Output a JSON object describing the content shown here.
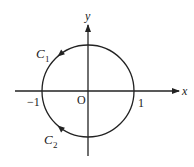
{
  "diagram": {
    "type": "complex-plane-contour",
    "axes": {
      "x_label": "x",
      "y_label": "y",
      "origin_label": "O"
    },
    "ticks": [
      {
        "value": -1,
        "label": "−1"
      },
      {
        "value": 1,
        "label": "1"
      }
    ],
    "circle": {
      "center": [
        0,
        0
      ],
      "radius": 1
    },
    "curves": [
      {
        "name": "C",
        "subscript": "1",
        "arc": "upper semicircle",
        "from": 1,
        "to": -1,
        "direction": "counterclockwise"
      },
      {
        "name": "C",
        "subscript": "2",
        "arc": "lower semicircle",
        "from": 1,
        "to": -1,
        "direction": "clockwise"
      }
    ],
    "colors": {
      "stroke": "#222222",
      "background": "#ffffff"
    }
  }
}
